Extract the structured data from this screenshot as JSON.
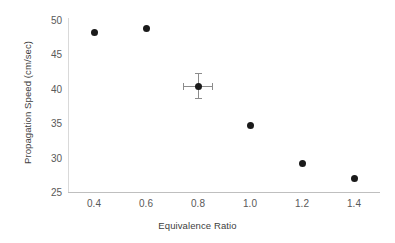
{
  "chart_data": {
    "type": "scatter",
    "title": "",
    "xlabel": "Equivalence Ratio",
    "ylabel": "Propagation Speed (cm/sec)",
    "xlim": [
      0.3,
      1.5
    ],
    "ylim": [
      25,
      50
    ],
    "grid": false,
    "legend": null,
    "xticks": [
      "0.4",
      "0.6",
      "0.8",
      "1.0",
      "1.2",
      "1.4"
    ],
    "xtick_values": [
      0.4,
      0.6,
      0.8,
      1.0,
      1.2,
      1.4
    ],
    "yticks": [
      "25",
      "30",
      "35",
      "40",
      "45",
      "50"
    ],
    "ytick_values": [
      25,
      30,
      35,
      40,
      45,
      50
    ],
    "marker_color": "#1a1a1a",
    "errorbar_color": "#8c8c8c",
    "axis_color": "#bfbfbf",
    "series": [
      {
        "name": "Propagation Speed",
        "x": [
          0.4,
          0.6,
          0.8,
          1.0,
          1.2,
          1.4
        ],
        "values": [
          48.2,
          48.7,
          40.4,
          34.7,
          29.1,
          27.0
        ],
        "yerr": [
          null,
          null,
          1.8,
          null,
          null,
          null
        ],
        "xerr": [
          null,
          null,
          0.055,
          null,
          null,
          null
        ]
      }
    ]
  }
}
